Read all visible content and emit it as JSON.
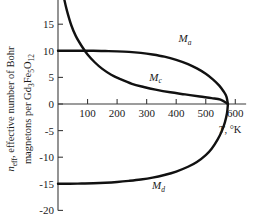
{
  "chart_data": {
    "type": "line",
    "title": "",
    "xlabel": "T, °K",
    "ylabel": "n_eff, effective number of Bohr magnetons per Gd3Fe5O12",
    "ylabel_line1": "effective number of Bohr",
    "ylabel_line2": "magnetons per Gd3Fe5O12",
    "ylabel_symbol": "n",
    "ylabel_symbol_sub": "eff",
    "xlim": [
      0,
      640
    ],
    "ylim": [
      -20,
      20
    ],
    "grid": false,
    "legend_position": "inline-curve-labels",
    "xticks": [
      100,
      200,
      300,
      400,
      500,
      600
    ],
    "xtick_labels": [
      "100",
      "200",
      "300",
      "400",
      "500",
      "600"
    ],
    "yticks": [
      20,
      15,
      10,
      5,
      0,
      -5,
      -10,
      -15,
      -20
    ],
    "ytick_labels": [
      "20",
      "15",
      "10",
      "5",
      "0",
      "-5",
      "-10",
      "-15",
      "-20"
    ],
    "curie_temperature": 575,
    "series": [
      {
        "name": "Ma",
        "label": "M",
        "label_sub": "a",
        "label_x": 430,
        "label_y": 11.6,
        "points": [
          [
            0,
            10.0
          ],
          [
            40,
            10.0
          ],
          [
            80,
            10.0
          ],
          [
            120,
            10.0
          ],
          [
            160,
            9.95
          ],
          [
            200,
            9.9
          ],
          [
            240,
            9.8
          ],
          [
            280,
            9.6
          ],
          [
            320,
            9.3
          ],
          [
            360,
            8.9
          ],
          [
            400,
            8.3
          ],
          [
            440,
            7.5
          ],
          [
            470,
            6.7
          ],
          [
            500,
            5.7
          ],
          [
            525,
            4.6
          ],
          [
            545,
            3.5
          ],
          [
            560,
            2.4
          ],
          [
            570,
            1.4
          ],
          [
            575,
            0.0
          ]
        ]
      },
      {
        "name": "Mc",
        "label": "M",
        "label_sub": "c",
        "label_x": 330,
        "label_y": 4.4,
        "points": [
          [
            0,
            27.0
          ],
          [
            10,
            23.0
          ],
          [
            20,
            20.0
          ],
          [
            30,
            17.6
          ],
          [
            45,
            14.8
          ],
          [
            60,
            12.8
          ],
          [
            80,
            10.9
          ],
          [
            100,
            9.3
          ],
          [
            125,
            7.8
          ],
          [
            150,
            6.6
          ],
          [
            180,
            5.5
          ],
          [
            210,
            4.7
          ],
          [
            250,
            3.8
          ],
          [
            290,
            3.2
          ],
          [
            330,
            2.7
          ],
          [
            380,
            2.2
          ],
          [
            430,
            1.8
          ],
          [
            480,
            1.4
          ],
          [
            520,
            1.1
          ],
          [
            550,
            0.8
          ],
          [
            575,
            0.0
          ]
        ]
      },
      {
        "name": "Md",
        "label": "M",
        "label_sub": "d",
        "label_x": 340,
        "label_y": -16.0,
        "points": [
          [
            0,
            -15.0
          ],
          [
            40,
            -15.0
          ],
          [
            80,
            -14.95
          ],
          [
            120,
            -14.9
          ],
          [
            160,
            -14.8
          ],
          [
            200,
            -14.65
          ],
          [
            240,
            -14.45
          ],
          [
            280,
            -14.2
          ],
          [
            320,
            -13.85
          ],
          [
            360,
            -13.35
          ],
          [
            400,
            -12.7
          ],
          [
            440,
            -11.8
          ],
          [
            470,
            -10.9
          ],
          [
            500,
            -9.6
          ],
          [
            520,
            -8.4
          ],
          [
            540,
            -6.7
          ],
          [
            555,
            -5.0
          ],
          [
            565,
            -3.4
          ],
          [
            572,
            -1.7
          ],
          [
            575,
            0.0
          ]
        ]
      }
    ]
  },
  "axis": {
    "x_title_main": "T",
    "x_title_rest": ", °K"
  }
}
